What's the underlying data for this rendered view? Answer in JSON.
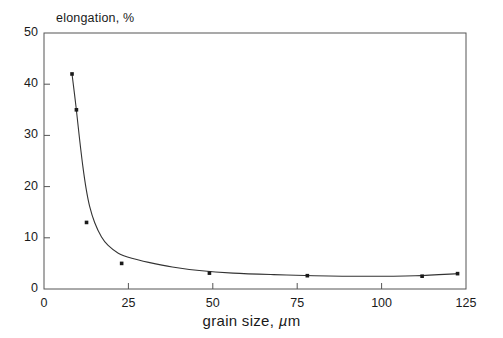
{
  "chart_data": {
    "type": "scatter",
    "title": "",
    "xlabel": "grain size, µm",
    "ylabel": "elongation, %",
    "xlim": [
      0,
      125
    ],
    "ylim": [
      0,
      50
    ],
    "xticks": [
      0,
      25,
      50,
      75,
      100,
      125
    ],
    "yticks": [
      0,
      10,
      20,
      30,
      40,
      50
    ],
    "grid": false,
    "legend": false,
    "marker": "square",
    "marker_color": "#1a1a1a",
    "line_color": "#333333",
    "frame_color": "#555555",
    "series": [
      {
        "name": "elongation vs grain size",
        "points": [
          {
            "x": 8.3,
            "y": 42.0
          },
          {
            "x": 9.6,
            "y": 35.0
          },
          {
            "x": 12.6,
            "y": 13.0
          },
          {
            "x": 23.0,
            "y": 5.0
          },
          {
            "x": 49.0,
            "y": 3.1
          },
          {
            "x": 78.0,
            "y": 2.6
          },
          {
            "x": 112.0,
            "y": 2.5
          },
          {
            "x": 122.5,
            "y": 3.0
          }
        ]
      }
    ],
    "fit_curve": {
      "description": "smooth decreasing hyperbolic trend line through the data",
      "points": [
        {
          "x": 8.3,
          "y": 42.0
        },
        {
          "x": 9.5,
          "y": 35.5
        },
        {
          "x": 10.5,
          "y": 29.5
        },
        {
          "x": 11.5,
          "y": 24.0
        },
        {
          "x": 12.5,
          "y": 19.5
        },
        {
          "x": 13.5,
          "y": 16.2
        },
        {
          "x": 15.0,
          "y": 13.0
        },
        {
          "x": 17.0,
          "y": 10.2
        },
        {
          "x": 19.0,
          "y": 8.5
        },
        {
          "x": 22.0,
          "y": 7.0
        },
        {
          "x": 26.0,
          "y": 6.0
        },
        {
          "x": 31.0,
          "y": 5.2
        },
        {
          "x": 38.0,
          "y": 4.3
        },
        {
          "x": 46.0,
          "y": 3.6
        },
        {
          "x": 56.0,
          "y": 3.1
        },
        {
          "x": 68.0,
          "y": 2.8
        },
        {
          "x": 80.0,
          "y": 2.6
        },
        {
          "x": 95.0,
          "y": 2.5
        },
        {
          "x": 110.0,
          "y": 2.6
        },
        {
          "x": 122.5,
          "y": 3.0
        }
      ]
    }
  },
  "axis": {
    "y_title": "elongation, %",
    "x_title_main": "grain size, ",
    "x_title_mu": "µ",
    "x_title_tail": "m",
    "y_tick_labels": [
      "50",
      "40",
      "30",
      "20",
      "10",
      "0"
    ],
    "x_tick_labels": [
      "0",
      "25",
      "50",
      "75",
      "100",
      "125"
    ]
  }
}
